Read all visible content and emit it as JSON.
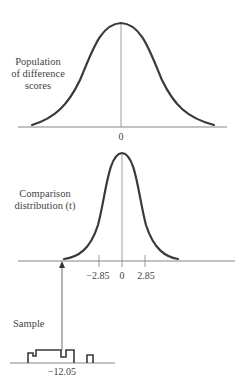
{
  "figure": {
    "panels": [
      {
        "id": "population",
        "label_lines": [
          "Population",
          "of difference",
          "scores"
        ],
        "ticks": [
          {
            "value": "0"
          }
        ]
      },
      {
        "id": "comparison",
        "label_lines": [
          "Comparison",
          "distribution (t)"
        ],
        "ticks": [
          {
            "value": "−2.85"
          },
          {
            "value": "0"
          },
          {
            "value": "2.85"
          }
        ]
      },
      {
        "id": "sample",
        "label_lines": [
          "Sample"
        ],
        "ticks": [
          {
            "value": "−12.05"
          }
        ]
      }
    ],
    "colors": {
      "curve": "#3a3a3a",
      "axis": "#555555",
      "text": "#444444",
      "background": "#ffffff"
    }
  }
}
